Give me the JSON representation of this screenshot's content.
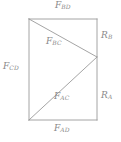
{
  "figure": {
    "type": "geometry-diagram",
    "stroke_color": "#9a9a9a",
    "label_color": "#8a8a8a",
    "background_color": "#ffffff",
    "geometry": {
      "rect": {
        "left": 29,
        "top": 19,
        "right": 97,
        "bottom": 120
      },
      "right_vertex": {
        "x": 97,
        "y": 57
      },
      "edges": [
        {
          "name": "top-edge",
          "from": [
            29,
            19
          ],
          "to": [
            97,
            19
          ]
        },
        {
          "name": "left-edge",
          "from": [
            29,
            19
          ],
          "to": [
            29,
            120
          ]
        },
        {
          "name": "bottom-edge",
          "from": [
            29,
            120
          ],
          "to": [
            97,
            120
          ]
        },
        {
          "name": "right-edge-upper",
          "from": [
            97,
            19
          ],
          "to": [
            97,
            57
          ]
        },
        {
          "name": "right-edge-lower",
          "from": [
            97,
            57
          ],
          "to": [
            97,
            120
          ]
        }
      ],
      "diagonals": [
        {
          "name": "upper-diagonal",
          "from": [
            29,
            19
          ],
          "to": [
            97,
            57
          ]
        },
        {
          "name": "lower-diagonal",
          "from": [
            29,
            120
          ],
          "to": [
            97,
            57
          ]
        }
      ]
    },
    "labels": {
      "top": {
        "base": "F",
        "sub": "BD"
      },
      "left": {
        "base": "F",
        "sub": "CD"
      },
      "upper_diagonal": {
        "base": "F",
        "sub": "BC"
      },
      "lower_diagonal": {
        "base": "F",
        "sub": "AC"
      },
      "bottom": {
        "base": "F",
        "sub": "AD"
      },
      "right_upper": {
        "base": "R",
        "sub": "B"
      },
      "right_lower": {
        "base": "R",
        "sub": "A"
      }
    }
  }
}
